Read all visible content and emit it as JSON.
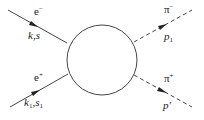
{
  "diagram": {
    "type": "feynman",
    "colors": {
      "line": "#444444",
      "text": "#222222",
      "background": "#ffffff"
    },
    "blob": {
      "shape": "circle",
      "cx": 102,
      "cy": 60,
      "r": 35
    },
    "incoming": [
      {
        "particle": "e",
        "charge": "−",
        "momentum_label": "k,s",
        "line_style": "solid"
      },
      {
        "particle": "e",
        "charge": "+",
        "momentum": "k",
        "momentum_sub": "1",
        "spin": "s",
        "spin_sub": "1",
        "line_style": "solid"
      }
    ],
    "outgoing": [
      {
        "particle": "π",
        "charge": "−",
        "momentum": "p",
        "momentum_sub": "1",
        "line_style": "dashed"
      },
      {
        "particle": "π",
        "charge": "+",
        "momentum": "p′",
        "line_style": "dashed"
      }
    ]
  }
}
